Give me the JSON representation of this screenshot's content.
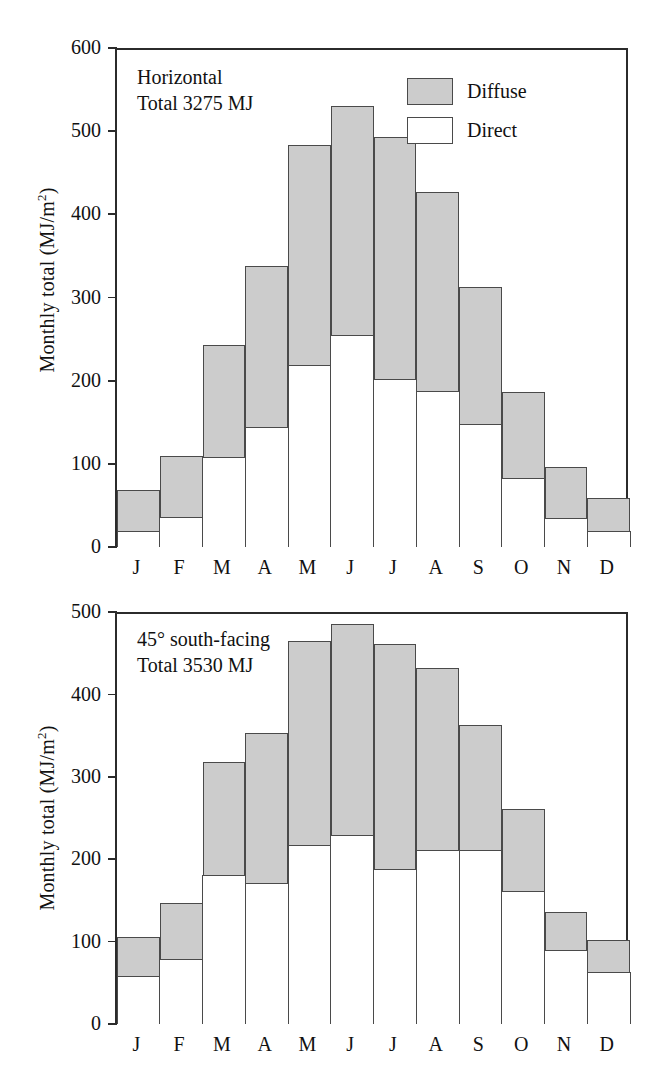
{
  "figure": {
    "axis_label": "Monthly total (MJ/m",
    "axis_label_sup": "2",
    "axis_label_close": ")",
    "legend": {
      "diffuse_label": "Diffuse",
      "direct_label": "Direct",
      "diffuse_color": "#cccccc",
      "direct_color": "#ffffff",
      "outline_color": "#4a4a4a"
    }
  },
  "chart_data": [
    {
      "type": "bar",
      "id": "horizontal",
      "stacked": true,
      "title": "Horizontal",
      "subtitle": "Total 3275 MJ",
      "xlabel": "",
      "ylabel": "Monthly total (MJ/m2)",
      "ylim": [
        0,
        600
      ],
      "yticks": [
        0,
        100,
        200,
        300,
        400,
        500,
        600
      ],
      "ytick_labels": [
        "0",
        "100",
        "200",
        "300",
        "400",
        "500",
        "600"
      ],
      "grid": false,
      "legend_position": "top-right",
      "categories": [
        "J",
        "F",
        "M",
        "A",
        "M",
        "J",
        "J",
        "A",
        "S",
        "O",
        "N",
        "D"
      ],
      "series": [
        {
          "name": "Direct",
          "values": [
            19,
            35,
            108,
            144,
            218,
            254,
            201,
            187,
            147,
            82,
            34,
            19
          ]
        },
        {
          "name": "Diffuse",
          "values": [
            47,
            72,
            133,
            192,
            263,
            274,
            289,
            238,
            163,
            102,
            60,
            38
          ]
        }
      ],
      "totals": [
        66,
        107,
        241,
        336,
        481,
        528,
        490,
        425,
        310,
        184,
        94,
        57
      ]
    },
    {
      "type": "bar",
      "id": "tilted-45-south",
      "stacked": true,
      "title": "45° south-facing",
      "subtitle": "Total 3530 MJ",
      "xlabel": "",
      "ylabel": "Monthly total (MJ/m2)",
      "ylim": [
        0,
        500
      ],
      "yticks": [
        0,
        100,
        200,
        300,
        400,
        500
      ],
      "ytick_labels": [
        "0",
        "100",
        "200",
        "300",
        "400",
        "500"
      ],
      "grid": false,
      "legend_position": "none",
      "categories": [
        "J",
        "F",
        "M",
        "A",
        "M",
        "J",
        "J",
        "A",
        "S",
        "O",
        "N",
        "D"
      ],
      "series": [
        {
          "name": "Direct",
          "values": [
            58,
            78,
            180,
            171,
            217,
            229,
            188,
            211,
            210,
            161,
            89,
            62
          ]
        },
        {
          "name": "Diffuse",
          "values": [
            45,
            67,
            135,
            180,
            246,
            254,
            271,
            219,
            150,
            97,
            45,
            38
          ]
        }
      ],
      "totals": [
        103,
        145,
        315,
        351,
        463,
        483,
        459,
        430,
        360,
        258,
        134,
        100
      ]
    }
  ]
}
